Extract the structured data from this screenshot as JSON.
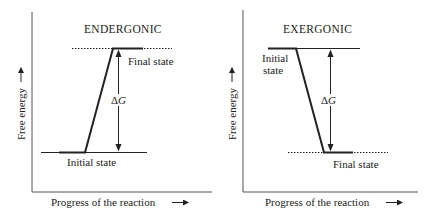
{
  "colors": {
    "ink": "#222222",
    "axis": "#555555",
    "background": "#ffffff"
  },
  "panels": [
    {
      "title": "ENDERGONIC",
      "y_axis_label": "Free energy",
      "x_axis_label": "Progress of the reaction",
      "initial_state_label": "Initial state",
      "final_state_label": "Final state",
      "delta_label_symbol": "Δ",
      "delta_label_var": "G"
    },
    {
      "title": "EXERGONIC",
      "y_axis_label": "Free energy",
      "x_axis_label": "Progress of the reaction",
      "initial_state_label_line1": "Initial",
      "initial_state_label_line2": "state",
      "final_state_label": "Final state",
      "delta_label_symbol": "Δ",
      "delta_label_var": "G"
    }
  ]
}
